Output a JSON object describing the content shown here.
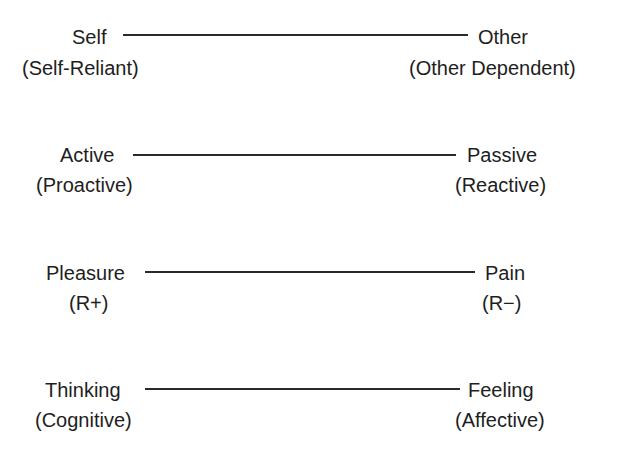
{
  "dimensions": [
    {
      "left": {
        "label": "Self",
        "sub": "(Self-Reliant)"
      },
      "right": {
        "label": "Other",
        "sub": "(Other Dependent)"
      }
    },
    {
      "left": {
        "label": "Active",
        "sub": "(Proactive)"
      },
      "right": {
        "label": "Passive",
        "sub": "(Reactive)"
      }
    },
    {
      "left": {
        "label": "Pleasure",
        "sub": "(R+)"
      },
      "right": {
        "label": "Pain",
        "sub": "(R−)"
      }
    },
    {
      "left": {
        "label": "Thinking",
        "sub": "(Cognitive)"
      },
      "right": {
        "label": "Feeling",
        "sub": "(Affective)"
      }
    }
  ]
}
